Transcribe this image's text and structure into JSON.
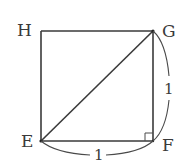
{
  "figure": {
    "type": "square-with-diagonal",
    "vertices": {
      "H": {
        "label": "H",
        "position": "top-left"
      },
      "G": {
        "label": "G",
        "position": "top-right"
      },
      "E": {
        "label": "E",
        "position": "bottom-left"
      },
      "F": {
        "label": "F",
        "position": "bottom-right"
      }
    },
    "segments": [
      "HG",
      "HE",
      "GF",
      "EF",
      "EG"
    ],
    "diagonal": "EG",
    "right_angle_at": "F",
    "measurements": {
      "GF": "1",
      "EF": "1"
    }
  }
}
